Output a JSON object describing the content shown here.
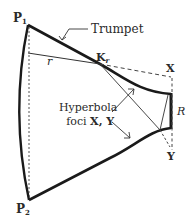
{
  "diagram": {
    "labels": {
      "p1": "P",
      "p1_sub": "1",
      "p2": "P",
      "p2_sub": "2",
      "trumpet": "Trumpet",
      "k": "K",
      "k_sub": "r",
      "r_small": "r",
      "x": "X",
      "y": "Y",
      "r_big": "R",
      "hyperbola_line1": "Hyperbola",
      "hyperbola_line2_prefix": "foci ",
      "hyperbola_line2_foci": "X, Y"
    },
    "colors": {
      "stroke": "#1a1a1a",
      "thin": "#333333",
      "text": "#2a2a2a"
    }
  }
}
